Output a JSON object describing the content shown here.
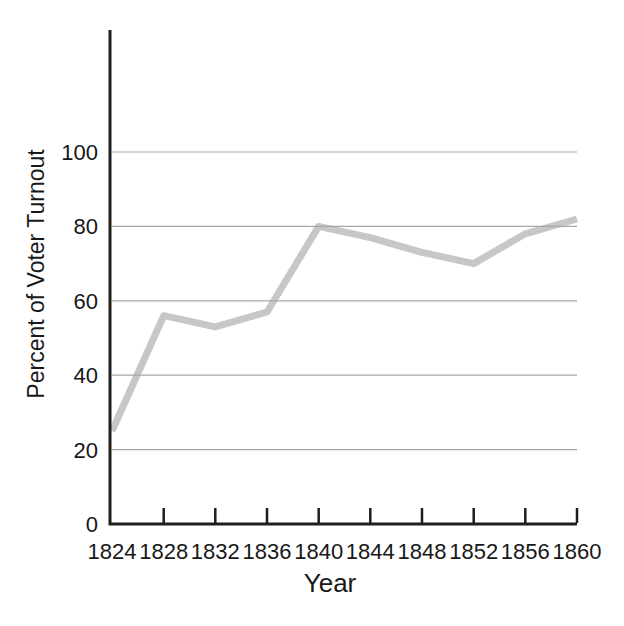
{
  "figure": {
    "background": "#ffffff"
  },
  "chart_data": {
    "type": "line",
    "xlabel": "Year",
    "ylabel": "Percent of Voter Turnout",
    "x": [
      1824,
      1828,
      1832,
      1836,
      1840,
      1844,
      1848,
      1852,
      1856,
      1860
    ],
    "values": [
      25,
      56,
      53,
      57,
      80,
      77,
      73,
      70,
      78,
      82
    ],
    "ylim": [
      0,
      100
    ],
    "y_ticks": [
      0,
      20,
      40,
      60,
      80,
      100
    ],
    "x_tick_labels": [
      "1824",
      "1828",
      "1832",
      "1836",
      "1840",
      "1844",
      "1848",
      "1852",
      "1856",
      "1860"
    ],
    "grid": "horizontal gridlines at 20, 40, 60, 80, 100",
    "legend": "none",
    "styles": {
      "line_color": "#c7c7c7",
      "grid_color": "#a6a6a6",
      "axis_color": "#1e1e1e",
      "text_color": "#181818"
    }
  }
}
